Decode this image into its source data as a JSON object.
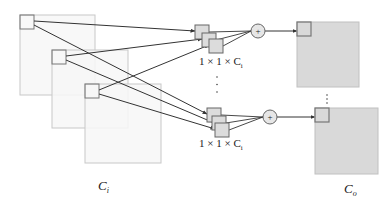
{
  "diagram": {
    "colors": {
      "input_fill": "#f7f7f7",
      "input_stroke": "#c8c8c8",
      "output_fill": "#d9d9d9",
      "output_stroke": "#c0c0c0",
      "patch_stroke": "#777777",
      "kernel_fill": "#dcdcdc",
      "kernel_stroke": "#666666",
      "line": "#333333",
      "sum_fill": "#e6e6e6"
    },
    "input_maps": [
      {
        "x": 20,
        "y": 15,
        "w": 75,
        "h": 80
      },
      {
        "x": 52,
        "y": 50,
        "w": 76,
        "h": 78
      },
      {
        "x": 85,
        "y": 84,
        "w": 76,
        "h": 79
      }
    ],
    "input_patches": [
      {
        "x": 20,
        "y": 15,
        "s": 14
      },
      {
        "x": 52,
        "y": 50,
        "s": 14
      },
      {
        "x": 85,
        "y": 84,
        "s": 14
      }
    ],
    "kernel_groups": [
      {
        "cubes": [
          {
            "x": 195,
            "y": 25
          },
          {
            "x": 202,
            "y": 33
          },
          {
            "x": 209,
            "y": 39
          }
        ],
        "label": {
          "prefix": "1 × 1 × C",
          "sub": "i",
          "x": 199,
          "y": 65
        },
        "sum": {
          "cx": 258,
          "cy": 31,
          "r": 7,
          "symbol": "+"
        },
        "output": {
          "x": 297,
          "y": 22,
          "w": 62,
          "h": 65,
          "patch": 14
        }
      },
      {
        "cubes": [
          {
            "x": 207,
            "y": 108
          },
          {
            "x": 212,
            "y": 116
          },
          {
            "x": 215,
            "y": 123
          }
        ],
        "label": {
          "prefix": "1 × 1 × C",
          "sub": "i",
          "x": 199,
          "y": 147
        },
        "sum": {
          "cx": 270,
          "cy": 117,
          "r": 7,
          "symbol": "+"
        },
        "output": {
          "x": 315,
          "y": 108,
          "w": 63,
          "h": 66,
          "patch": 14
        }
      }
    ],
    "ellipsis_kernels": {
      "x": 217,
      "y1": 77,
      "y2": 92,
      "symbol": "⋮"
    },
    "ellipsis_outputs": {
      "x": 327,
      "y1": 95,
      "y2": 103,
      "symbol": "⋮"
    },
    "labels": {
      "input": {
        "main": "C",
        "sub": "i",
        "x": 98,
        "y": 190
      },
      "output": {
        "main": "C",
        "sub": "o",
        "x": 344,
        "y": 193
      }
    }
  }
}
